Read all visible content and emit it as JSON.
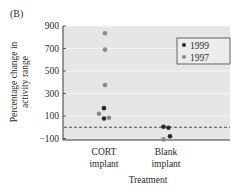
{
  "panel_label": "(B)",
  "chart_data": {
    "type": "scatter",
    "title": "",
    "xlabel": "Treatment",
    "ylabel_lines": [
      "Percentage change in",
      "activity range"
    ],
    "ylabel": "Percentage change in activity range",
    "categories": [
      "CORT implant",
      "Blank implant"
    ],
    "category_lines": [
      [
        "CORT",
        "implant"
      ],
      [
        "Blank",
        "implant"
      ]
    ],
    "yticks": [
      900,
      700,
      500,
      300,
      100,
      -100
    ],
    "ylim": [
      -100,
      900
    ],
    "grid": true,
    "reference_line": {
      "y": 0,
      "style": "dashed"
    },
    "legend": {
      "placement": "top-right"
    },
    "series": [
      {
        "name": "1999",
        "color": "#2b2b2b",
        "points": [
          {
            "category": "CORT implant",
            "offset": 0,
            "y": 170
          },
          {
            "category": "CORT implant",
            "offset": 0,
            "y": 78
          },
          {
            "category": "Blank implant",
            "offset": -0.05,
            "y": 5
          },
          {
            "category": "Blank implant",
            "offset": 0.05,
            "y": -5
          },
          {
            "category": "Blank implant",
            "offset": 0.08,
            "y": -80
          }
        ]
      },
      {
        "name": "1997",
        "color": "#8a8a8a",
        "points": [
          {
            "category": "CORT implant",
            "offset": 0.02,
            "y": 835
          },
          {
            "category": "CORT implant",
            "offset": 0.02,
            "y": 690
          },
          {
            "category": "CORT implant",
            "offset": 0.02,
            "y": 375
          },
          {
            "category": "CORT implant",
            "offset": -0.1,
            "y": 120
          },
          {
            "category": "CORT implant",
            "offset": 0.1,
            "y": 85
          },
          {
            "category": "Blank implant",
            "offset": -0.05,
            "y": -108
          }
        ]
      }
    ]
  }
}
